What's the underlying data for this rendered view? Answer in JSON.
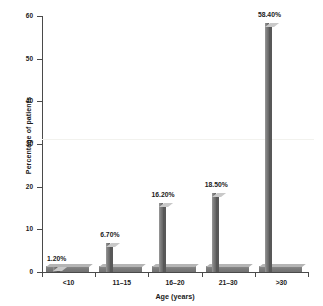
{
  "chart_data": {
    "type": "bar",
    "title": "",
    "xlabel": "Age (years)",
    "ylabel": "Percentage of patients",
    "categories": [
      "<10",
      "11–15",
      "16–20",
      "21–30",
      ">30"
    ],
    "values": [
      1.2,
      6.7,
      16.2,
      18.5,
      58.4
    ],
    "data_labels": [
      "1.20%",
      "6.70%",
      "16.20%",
      "18.50%",
      "58.40%"
    ],
    "ylim": [
      0,
      60
    ],
    "yticks": [
      0,
      10,
      20,
      30,
      40,
      50,
      60
    ],
    "ytick_labels": [
      "0",
      "10",
      "20",
      "30",
      "40",
      "50",
      "60"
    ],
    "grid": false,
    "legend": null,
    "style": "3d-bar",
    "series": [
      {
        "name": "Percentage of patients",
        "values": [
          1.2,
          6.7,
          16.2,
          18.5,
          58.4
        ]
      }
    ]
  },
  "colors": {
    "bar_front": "#7a7a7a",
    "bar_top": "#c9c9c9",
    "bar_side": "#585858",
    "axis": "#4a4a4a",
    "text": "#1a1a1a",
    "background": "#ffffff"
  }
}
